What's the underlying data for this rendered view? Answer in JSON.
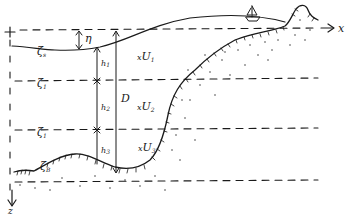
{
  "diagram": {
    "type": "layered ocean model cross-section",
    "axes": {
      "x_label": "x",
      "z_label": "z",
      "origin_marker": "+"
    },
    "interfaces": [
      {
        "id": "surface",
        "symbol": "ζ",
        "subscript": "s"
      },
      {
        "id": "interface-1",
        "symbol": "ζ",
        "subscript": "1"
      },
      {
        "id": "interface-2",
        "symbol": "ζ",
        "subscript": "1"
      },
      {
        "id": "bottom",
        "symbol": "ζ",
        "subscript": "B"
      }
    ],
    "layer_thicknesses": [
      {
        "symbol": "h",
        "subscript": "1"
      },
      {
        "symbol": "h",
        "subscript": "2"
      },
      {
        "symbol": "h",
        "subscript": "3"
      }
    ],
    "velocities": [
      {
        "symbol": "U",
        "subscript": "1",
        "marker": "x"
      },
      {
        "symbol": "U",
        "subscript": "2",
        "marker": "x"
      },
      {
        "symbol": "U",
        "subscript": "3",
        "marker": "x"
      }
    ],
    "elevation": {
      "symbol": "η"
    },
    "total_depth": {
      "symbol": "D"
    },
    "features": [
      "boat",
      "coastal hill",
      "sloping seabed",
      "dotted sediment"
    ]
  }
}
